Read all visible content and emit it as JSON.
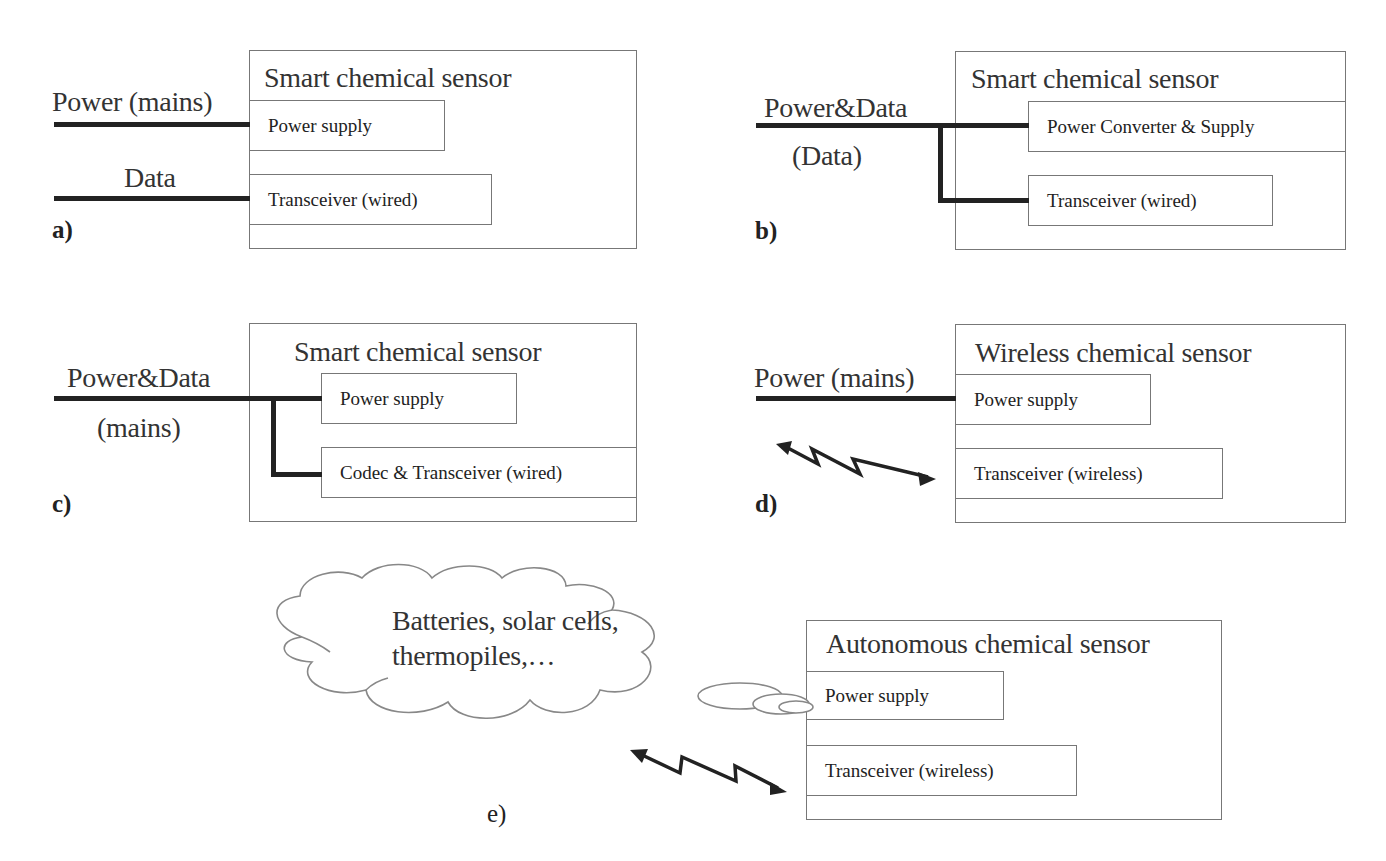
{
  "panels": {
    "a": {
      "letter": "a)",
      "title": "Smart chemical sensor",
      "inputs": [
        "Power (mains)",
        "Data"
      ],
      "components": [
        "Power supply",
        "Transceiver (wired)"
      ]
    },
    "b": {
      "letter": "b)",
      "title": "Smart chemical sensor",
      "inputs": [
        "Power&Data",
        "(Data)"
      ],
      "components": [
        "Power Converter & Supply",
        "Transceiver (wired)"
      ]
    },
    "c": {
      "letter": "c)",
      "title": "Smart chemical sensor",
      "inputs": [
        "Power&Data",
        "(mains)"
      ],
      "components": [
        "Power supply",
        "Codec & Transceiver (wired)"
      ]
    },
    "d": {
      "letter": "d)",
      "title": "Wireless chemical sensor",
      "inputs": [
        "Power (mains)"
      ],
      "components": [
        "Power supply",
        "Transceiver (wireless)"
      ]
    },
    "e": {
      "letter": "e)",
      "title": "Autonomous chemical sensor",
      "cloud": [
        "Batteries, solar cells,",
        "thermopiles,…"
      ],
      "components": [
        "Power supply",
        "Transceiver (wireless)"
      ]
    }
  },
  "icons": {
    "wireless_link": "zigzag-double-arrow",
    "energy_source": "thought-cloud"
  },
  "colors": {
    "wire": "#222222",
    "border": "#777777",
    "background": "#ffffff"
  }
}
